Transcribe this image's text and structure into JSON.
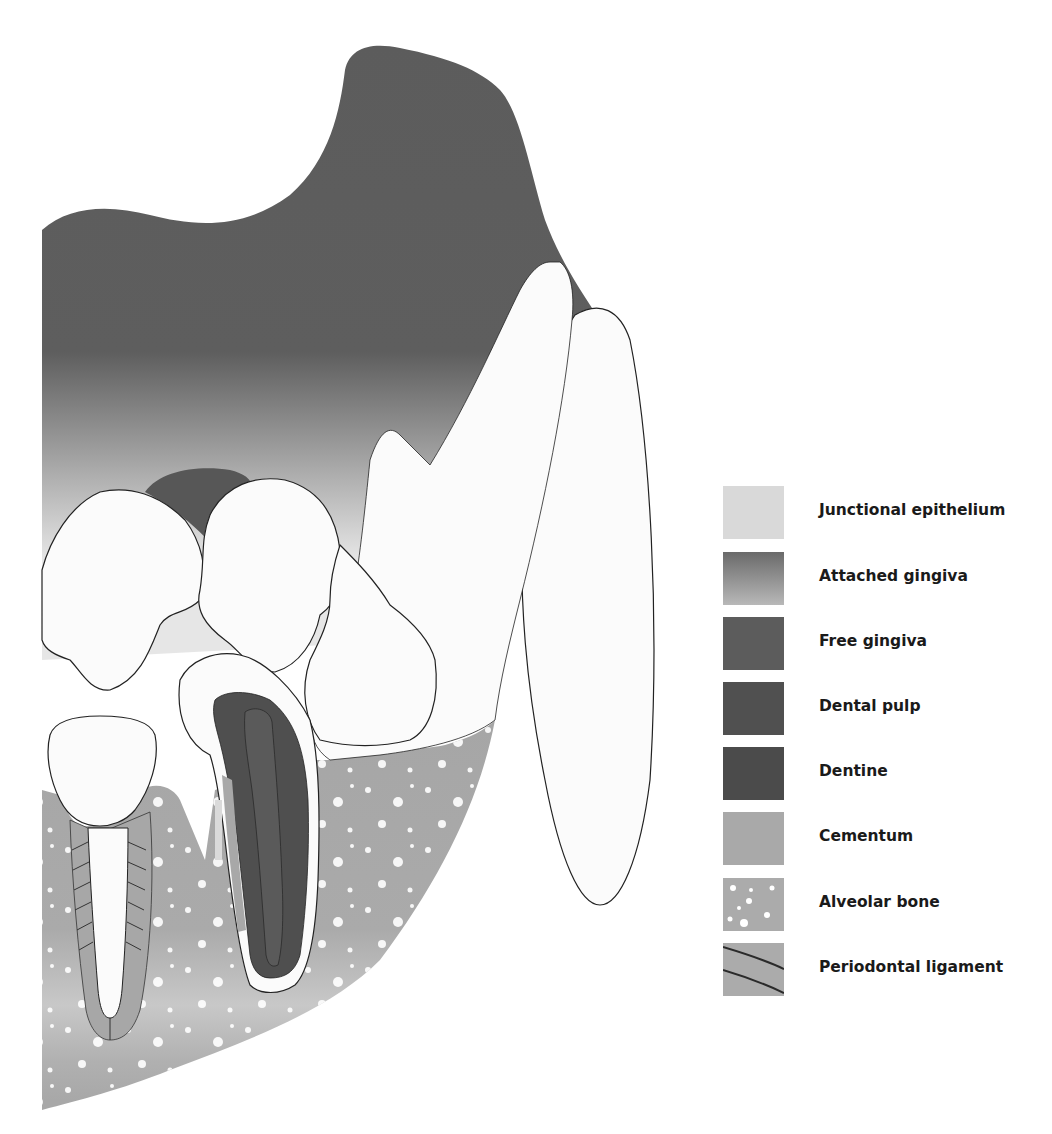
{
  "diagram": {
    "colors": {
      "free_gingiva": "#5a5a5a",
      "attached_gingiva_top": "#6a6a6a",
      "attached_gingiva_bottom": "#dcdcdc",
      "junctional_epithelium": "#d8d8d8",
      "dental_pulp": "#555555",
      "dentine": "#4e4e4e",
      "cementum": "#a8a8a8",
      "alveolar_bone": "#a9a9a9",
      "periodontal_ligament": "#ababab",
      "tooth_enamel": "#fbfbfb",
      "outline": "#222222"
    }
  },
  "legend": {
    "items": [
      {
        "label": "Junctional epithelium",
        "swatch": "junctional-epithelium"
      },
      {
        "label": "Attached gingiva",
        "swatch": "attached-gingiva"
      },
      {
        "label": "Free gingiva",
        "swatch": "free-gingiva"
      },
      {
        "label": "Dental pulp",
        "swatch": "dental-pulp"
      },
      {
        "label": "Dentine",
        "swatch": "dentine"
      },
      {
        "label": "Cementum",
        "swatch": "cementum"
      },
      {
        "label": "Alveolar bone",
        "swatch": "alveolar-bone"
      },
      {
        "label": "Periodontal ligament",
        "swatch": "periodontal-ligament"
      }
    ]
  }
}
